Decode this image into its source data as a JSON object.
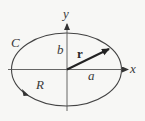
{
  "figure": {
    "colors": {
      "stroke": "#444444",
      "background": "#f7f7f5"
    },
    "geometry": {
      "center": [
        66.5,
        69.5
      ],
      "semi_axis_x": 55,
      "semi_axis_y": 36.5,
      "orientation": "counterclockwise"
    },
    "labels": {
      "curve": "C",
      "region": "R",
      "x_axis": "x",
      "y_axis": "y",
      "semi_major": "a",
      "semi_minor": "b",
      "vector": "r"
    }
  }
}
